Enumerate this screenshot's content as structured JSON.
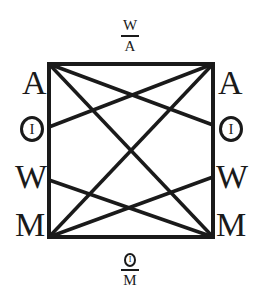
{
  "top_fraction": {
    "numerator": "W",
    "denominator": "A"
  },
  "bottom_fraction": {
    "numerator_symbol": "I",
    "denominator": "M"
  },
  "left_labels": [
    {
      "type": "letter",
      "text": "A"
    },
    {
      "type": "circled",
      "text": "I"
    },
    {
      "type": "letter",
      "text": "W"
    },
    {
      "type": "letter",
      "text": "M"
    }
  ],
  "right_labels": [
    {
      "type": "letter",
      "text": "A"
    },
    {
      "type": "circled",
      "text": "I"
    },
    {
      "type": "letter",
      "text": "W"
    },
    {
      "type": "letter",
      "text": "M"
    }
  ],
  "square": {
    "x1": 49,
    "y1": 64,
    "x2": 213,
    "y2": 237,
    "stroke": "#1a1a1a"
  },
  "connections": [
    {
      "from": "top-left",
      "to": "bottom-right"
    },
    {
      "from": "top-right",
      "to": "bottom-left"
    },
    {
      "from": "top-left",
      "to": "right-O"
    },
    {
      "from": "top-right",
      "to": "left-O"
    },
    {
      "from": "bottom-left",
      "to": "right-W"
    },
    {
      "from": "bottom-right",
      "to": "left-W"
    }
  ]
}
